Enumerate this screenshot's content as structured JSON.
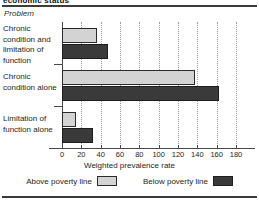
{
  "header": {
    "title": "economic status"
  },
  "axis_header_label": "Problem",
  "legend": {
    "above_label": "Above poverty line",
    "below_label": "Below poverty line",
    "above_color": "#d3d3d3",
    "below_color": "#3a3a3a"
  },
  "chart_data": {
    "type": "bar",
    "orientation": "horizontal",
    "title": "economic status",
    "xlabel": "Weighted prevalence rate",
    "ylabel": "Problem",
    "categories": [
      "Chronic condition and limitation of function",
      "Chronic condition alone",
      "Limitation of function alone"
    ],
    "series": [
      {
        "name": "Above poverty line",
        "color": "#d3d3d3",
        "values": [
          36,
          138,
          14
        ]
      },
      {
        "name": "Below poverty line",
        "color": "#3a3a3a",
        "values": [
          48,
          162,
          32
        ]
      }
    ],
    "xlim": [
      0,
      190
    ],
    "xticks": [
      0,
      20,
      40,
      60,
      80,
      100,
      120,
      140,
      160,
      180
    ],
    "grid": "vertical-dotted",
    "legend_position": "bottom"
  }
}
